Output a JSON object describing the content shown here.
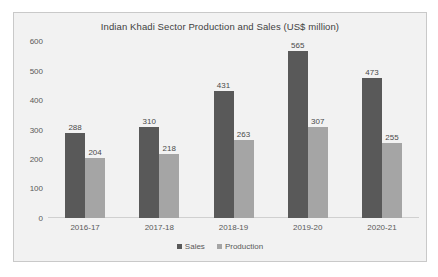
{
  "chart_data": {
    "type": "bar",
    "title": "Indian Khadi Sector Production and Sales (US$ million)",
    "xlabel": "",
    "ylabel": "",
    "ylim": [
      0,
      600
    ],
    "yticks": [
      "600",
      "500",
      "400",
      "300",
      "200",
      "100",
      "0"
    ],
    "grid": false,
    "legend_position": "bottom",
    "categories": [
      "2016-17",
      "2017-18",
      "2018-19",
      "2019-20",
      "2020-21"
    ],
    "series": [
      {
        "name": "Sales",
        "color": "#595959",
        "values": [
          288,
          310,
          431,
          565,
          473
        ],
        "labels": [
          "288",
          "310",
          "431",
          "565",
          "473"
        ]
      },
      {
        "name": "Production",
        "color": "#a5a5a5",
        "values": [
          204,
          218,
          263,
          307,
          255
        ],
        "labels": [
          "204",
          "218",
          "263",
          "307",
          "255"
        ]
      }
    ]
  },
  "legend": {
    "items": [
      {
        "label": "Sales"
      },
      {
        "label": "Production"
      }
    ]
  },
  "colors": {
    "series_sales": "#595959",
    "series_production": "#a5a5a5",
    "plot_background": "#f2f2f2",
    "border": "#c9c9c9",
    "text": "#595959"
  }
}
